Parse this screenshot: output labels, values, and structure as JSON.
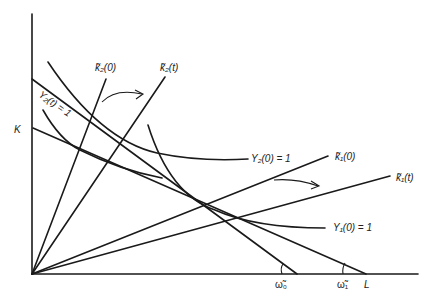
{
  "diagram": {
    "axes": {
      "y_label": "K",
      "x_label": "L"
    },
    "rays": [
      {
        "id": "k2_0",
        "label": "k̃₂(0)"
      },
      {
        "id": "k2_t",
        "label": "k̃₂(t)"
      },
      {
        "id": "k1_0",
        "label": "k̃₁(0)"
      },
      {
        "id": "k1_t",
        "label": "k̃₁(t)"
      }
    ],
    "isoquants": [
      {
        "id": "Y2_0",
        "label": "Y₂(0) = 1"
      },
      {
        "id": "Y2_t",
        "label": "Y₂(t) = 1"
      },
      {
        "id": "Y1_0",
        "label": "Y₁(0) = 1"
      }
    ],
    "wage_angles": [
      {
        "id": "w0",
        "label": "ω̃₀"
      },
      {
        "id": "w1",
        "label": "ω̃₁"
      }
    ],
    "arrows": [
      "k2 rotation arrow",
      "k1 rotation arrow"
    ],
    "colors": {
      "ink": "#1a1a1a",
      "background": "#ffffff"
    }
  }
}
